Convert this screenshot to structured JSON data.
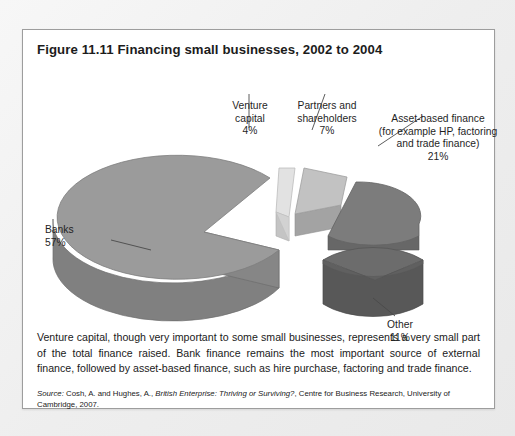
{
  "figure": {
    "title": "Figure 11.11  Financing small businesses, 2002 to 2004",
    "caption": "Venture capital, though very important to some small businesses, represents a very small part of the total finance raised. Bank finance remains the most important source of external finance, followed by asset-based finance, such as hire purchase, factoring and trade finance.",
    "source_prefix": "Source:",
    "source_authors": "Cosh, A. and Hughes, A.,",
    "source_title": "British Enterprise: Thriving or Surviving?",
    "source_rest": ", Centre for Business Research, University of Cambridge, 2007."
  },
  "labels": {
    "venture": "Venture\ncapital\n4%",
    "partners": "Partners and\nshareholders\n7%",
    "asset": "Asset-based finance\n(for example HP, factoring\nand trade finance)\n21%",
    "banks": "Banks\n57%",
    "other": "Other\n11%"
  },
  "chart_data": {
    "type": "pie",
    "title": "Financing small businesses, 2002 to 2004",
    "three_d": true,
    "exploded": true,
    "unit": "%",
    "categories": [
      "Banks",
      "Venture capital",
      "Partners and shareholders",
      "Asset-based finance (for example HP, factoring and trade finance)",
      "Other"
    ],
    "values": [
      57,
      4,
      7,
      21,
      11
    ],
    "labels": [
      "Banks 57%",
      "Venture capital 4%",
      "Partners and shareholders 7%",
      "Asset-based finance (for example HP, factoring and trade finance) 21%",
      "Other 11%"
    ],
    "colors": [
      "#9b9b9b",
      "#e2e2e2",
      "#c2c2c2",
      "#7c7c7c",
      "#6c6c6c"
    ],
    "legend": "none",
    "grid": false,
    "xlabel": "",
    "ylabel": ""
  },
  "colors": {
    "page_background": "#eeeeee",
    "panel_background": "#ffffff",
    "panel_border": "#9d9d9d",
    "text": "#1a1a1a",
    "leader_line": "#4a4a4a",
    "banks_top": "#9b9b9b",
    "banks_side": "#808080",
    "venture_top": "#e2e2e2",
    "venture_side": "#c4c4c4",
    "partners_top": "#c2c2c2",
    "partners_side": "#a3a3a3",
    "asset_top": "#7c7c7c",
    "asset_side": "#676767",
    "other_top": "#6c6c6c",
    "other_side": "#585858"
  }
}
